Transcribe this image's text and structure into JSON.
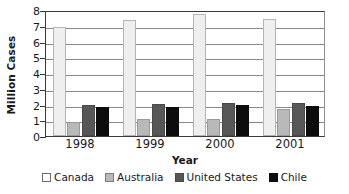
{
  "chart_data": {
    "type": "bar",
    "title": "",
    "subtitle": "",
    "xlabel": "Year",
    "ylabel": "Million Cases",
    "categories": [
      "1998",
      "1999",
      "2000",
      "2001"
    ],
    "series": [
      {
        "name": "Canada",
        "color": "#efefef",
        "values": [
          6.95,
          7.35,
          7.75,
          7.4
        ]
      },
      {
        "name": "Australia",
        "color": "#b9b9b9",
        "values": [
          0.9,
          1.05,
          1.05,
          1.7
        ]
      },
      {
        "name": "United States",
        "color": "#575757",
        "values": [
          2.0,
          2.05,
          2.1,
          2.1
        ]
      },
      {
        "name": "Chile",
        "color": "#0d0d0d",
        "values": [
          1.85,
          1.85,
          1.95,
          1.9
        ]
      }
    ],
    "ylim": [
      0,
      8
    ],
    "yticks": [
      0,
      1,
      2,
      3,
      4,
      5,
      6,
      7,
      8
    ],
    "ytick_labels": [
      "0",
      "1",
      "2",
      "3",
      "4",
      "5",
      "6",
      "7",
      "8"
    ],
    "grid": true,
    "grid_axis": "y",
    "legend_position": "bottom",
    "legend_entries": [
      "Canada",
      "Australia",
      "United States",
      "Chile"
    ],
    "annotations": []
  }
}
